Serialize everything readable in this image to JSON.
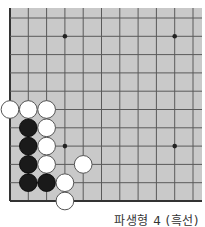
{
  "diagram": {
    "caption": "파생형 4 (흑선)",
    "colors": {
      "board": "#c9c9c9",
      "line": "#5a5a5a",
      "edge": "#333333",
      "black_stone": "#1a1a1a",
      "white_stone": "#ffffff",
      "white_stone_outline": "#555555",
      "star_point": "#222222"
    },
    "grid": {
      "origin_x": 10,
      "origin_y": 18,
      "spacing": 18.3,
      "columns": 11,
      "rows": 11,
      "board_top": 8,
      "board_right": 202,
      "left_edge": true,
      "bottom_edge": true
    },
    "star_points": [
      {
        "col": 3,
        "row": 1
      },
      {
        "col": 9,
        "row": 1
      },
      {
        "col": 3,
        "row": 7
      },
      {
        "col": 9,
        "row": 7
      }
    ],
    "stones": [
      {
        "color": "white",
        "col": 0,
        "row": 5
      },
      {
        "color": "white",
        "col": 1,
        "row": 5
      },
      {
        "color": "white",
        "col": 2,
        "row": 5
      },
      {
        "color": "black",
        "col": 1,
        "row": 6
      },
      {
        "color": "white",
        "col": 2,
        "row": 6
      },
      {
        "color": "black",
        "col": 1,
        "row": 7
      },
      {
        "color": "white",
        "col": 2,
        "row": 7
      },
      {
        "color": "black",
        "col": 1,
        "row": 8
      },
      {
        "color": "white",
        "col": 2,
        "row": 8
      },
      {
        "color": "white",
        "col": 4,
        "row": 8
      },
      {
        "color": "black",
        "col": 1,
        "row": 9
      },
      {
        "color": "black",
        "col": 2,
        "row": 9
      },
      {
        "color": "white",
        "col": 3,
        "row": 9
      },
      {
        "color": "white",
        "col": 3,
        "row": 10
      }
    ]
  }
}
